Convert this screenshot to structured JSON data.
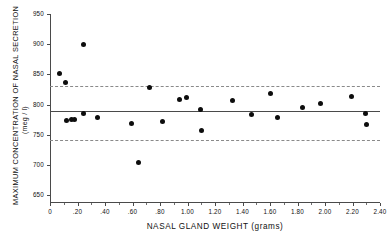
{
  "chart_data": {
    "type": "scatter",
    "title": "",
    "xlabel": "NASAL GLAND WEIGHT (grams)",
    "ylabel": "MAXIMUM CONCENTRATION OF NASAL SECRETION",
    "ylabel_units": "(meg / l)",
    "xlim": [
      0,
      2.4
    ],
    "ylim": [
      637,
      950
    ],
    "grid": false,
    "legend": null,
    "xticks": [
      0,
      0.2,
      0.4,
      0.6,
      0.8,
      1.0,
      1.2,
      1.4,
      1.6,
      1.8,
      2.0,
      2.2,
      2.4
    ],
    "xtick_labels": [
      "0",
      ".20",
      ".40",
      ".60",
      ".80",
      "1.00",
      "1.20",
      "1.40",
      "1.60",
      "1.80",
      "2.00",
      "2.20",
      "2.40"
    ],
    "xticks_minor": [
      0.1,
      0.3,
      0.5,
      0.7,
      0.9,
      1.1,
      1.3,
      1.5,
      1.7,
      1.9,
      2.1,
      2.3
    ],
    "yticks": [
      650,
      700,
      750,
      800,
      850,
      900,
      950
    ],
    "ytick_labels": [
      "650",
      "700",
      "750",
      "800",
      "850",
      "900",
      "950"
    ],
    "reference_lines": [
      {
        "name": "mean",
        "style": "solid",
        "y": 789
      },
      {
        "name": "upper-limit",
        "style": "dashed",
        "y": 831
      },
      {
        "name": "lower-limit",
        "style": "dashed",
        "y": 741
      }
    ],
    "points": [
      {
        "x": 0.07,
        "y": 851
      },
      {
        "x": 0.11,
        "y": 837
      },
      {
        "x": 0.12,
        "y": 774
      },
      {
        "x": 0.155,
        "y": 775
      },
      {
        "x": 0.175,
        "y": 775
      },
      {
        "x": 0.24,
        "y": 786
      },
      {
        "x": 0.245,
        "y": 899
      },
      {
        "x": 0.345,
        "y": 778
      },
      {
        "x": 0.595,
        "y": 768
      },
      {
        "x": 0.64,
        "y": 704
      },
      {
        "x": 0.725,
        "y": 829
      },
      {
        "x": 0.815,
        "y": 772
      },
      {
        "x": 0.945,
        "y": 809
      },
      {
        "x": 0.995,
        "y": 811
      },
      {
        "x": 1.095,
        "y": 792
      },
      {
        "x": 1.105,
        "y": 757
      },
      {
        "x": 1.33,
        "y": 806
      },
      {
        "x": 1.465,
        "y": 783
      },
      {
        "x": 1.605,
        "y": 818
      },
      {
        "x": 1.655,
        "y": 778
      },
      {
        "x": 1.835,
        "y": 795
      },
      {
        "x": 1.965,
        "y": 802
      },
      {
        "x": 2.195,
        "y": 814
      },
      {
        "x": 2.295,
        "y": 786
      },
      {
        "x": 2.3,
        "y": 767
      }
    ]
  }
}
